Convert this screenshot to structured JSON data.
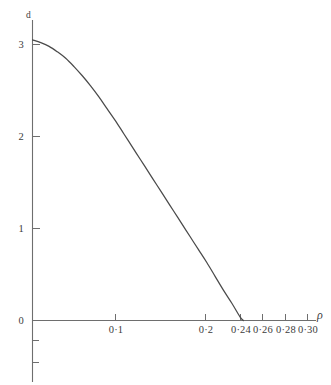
{
  "chart_data": {
    "type": "line",
    "title": "",
    "subtitle": "",
    "xlabel": "ρ",
    "ylabel": "d",
    "xlim": [
      0,
      0.315
    ],
    "ylim": [
      -0.55,
      3.3
    ],
    "grid": false,
    "legend": null,
    "x_tick_labels": [
      "0·1",
      "0·2",
      "0·24",
      "0·26",
      "0·28",
      "0·30"
    ],
    "x_tick_values": [
      0.1,
      0.2,
      0.24,
      0.26,
      0.28,
      0.3
    ],
    "y_tick_labels": [
      "0",
      "1",
      "2",
      "3"
    ],
    "y_tick_values": [
      0,
      1,
      2,
      3
    ],
    "y_minor_tick_values": [
      -0.2,
      -0.45
    ],
    "series": [
      {
        "name": "d",
        "x": [
          0.0,
          0.01,
          0.02,
          0.03,
          0.04,
          0.05,
          0.06,
          0.07,
          0.08,
          0.09,
          0.1,
          0.11,
          0.12,
          0.13,
          0.14,
          0.15,
          0.16,
          0.17,
          0.18,
          0.19,
          0.2,
          0.21,
          0.22,
          0.23,
          0.24,
          0.25,
          0.254
        ],
        "values": [
          3.05,
          3.02,
          2.98,
          2.92,
          2.85,
          2.76,
          2.66,
          2.55,
          2.43,
          2.3,
          2.17,
          2.03,
          1.89,
          1.75,
          1.61,
          1.47,
          1.33,
          1.19,
          1.05,
          0.91,
          0.77,
          0.63,
          0.48,
          0.33,
          0.19,
          0.04,
          0.0
        ]
      }
    ],
    "annotations": []
  },
  "axes": {
    "y_axis_title": "d",
    "x_axis_title": "ρ"
  },
  "ticks": {
    "x": [
      {
        "label": "0·1",
        "value": 0.1
      },
      {
        "label": "0·2",
        "value": 0.2
      },
      {
        "label": "0·24",
        "value": 0.24
      },
      {
        "label": "0·26",
        "value": 0.26
      },
      {
        "label": "0·28",
        "value": 0.28
      },
      {
        "label": "0·30",
        "value": 0.3
      }
    ],
    "y": [
      {
        "label": "3",
        "value": 3
      },
      {
        "label": "2",
        "value": 2
      },
      {
        "label": "1",
        "value": 1
      },
      {
        "label": "0",
        "value": 0
      }
    ]
  },
  "style": {
    "background": "#ffffff",
    "axis_color": "#6e6e6e",
    "curve_color": "#4a4a4a",
    "text_color": "#3c3c3c"
  }
}
